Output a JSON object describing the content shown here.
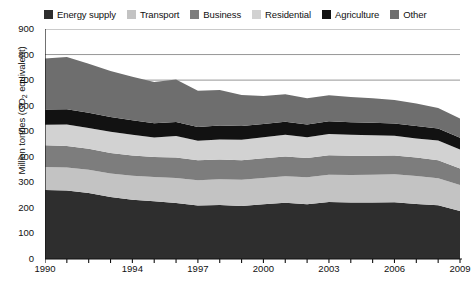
{
  "chart_data": {
    "type": "area",
    "stacked": true,
    "title": "",
    "xlabel": "",
    "ylabel": "Million tonnes (CO2 equivalent)",
    "ylabel_display": "Million tonnes (CO",
    "ylabel_sub": "2",
    "ylabel_tail": " equivalent)",
    "ylim": [
      0,
      900
    ],
    "ytick_labels": [
      "900",
      "800",
      "700",
      "600",
      "500",
      "400",
      "300",
      "200",
      "100",
      "0"
    ],
    "ytick_values": [
      900,
      800,
      700,
      600,
      500,
      400,
      300,
      200,
      100,
      0
    ],
    "xlim": [
      1990,
      2009
    ],
    "xtick_labels": [
      "1990",
      "1994",
      "1997",
      "2000",
      "2003",
      "2006",
      "2009"
    ],
    "xtick_values": [
      1990,
      1994,
      1997,
      2000,
      2003,
      2006,
      2009
    ],
    "grid": "horizontal-top-only",
    "gridlines": [
      900,
      800,
      700
    ],
    "legend_position": "top",
    "x": [
      1990,
      1991,
      1992,
      1993,
      1994,
      1995,
      1996,
      1997,
      1998,
      1999,
      2000,
      2001,
      2002,
      2003,
      2004,
      2005,
      2006,
      2007,
      2008,
      2009
    ],
    "series": [
      {
        "name": "Energy supply",
        "color": "#2e2e2e",
        "values": [
          270,
          268,
          258,
          243,
          232,
          226,
          219,
          209,
          211,
          207,
          214,
          220,
          214,
          223,
          221,
          221,
          222,
          215,
          210,
          188
        ]
      },
      {
        "name": "Transport",
        "color": "#c3c3c3",
        "values": [
          90,
          90,
          91,
          92,
          94,
          95,
          98,
          99,
          101,
          103,
          103,
          104,
          106,
          107,
          108,
          109,
          110,
          110,
          106,
          102
        ]
      },
      {
        "name": "Business",
        "color": "#7d7d7d",
        "values": [
          85,
          84,
          82,
          80,
          79,
          78,
          80,
          78,
          77,
          76,
          77,
          77,
          75,
          76,
          75,
          74,
          73,
          72,
          70,
          64
        ]
      },
      {
        "name": "Residential",
        "color": "#d2d2d2",
        "values": [
          80,
          84,
          82,
          83,
          81,
          76,
          84,
          77,
          79,
          81,
          82,
          85,
          81,
          83,
          82,
          80,
          77,
          75,
          78,
          74
        ]
      },
      {
        "name": "Agriculture",
        "color": "#121212",
        "values": [
          60,
          60,
          59,
          58,
          57,
          56,
          55,
          54,
          54,
          53,
          52,
          51,
          50,
          50,
          49,
          49,
          48,
          48,
          47,
          46
        ]
      },
      {
        "name": "Other",
        "color": "#6e6e6e",
        "values": [
          200,
          204,
          192,
          180,
          170,
          162,
          166,
          141,
          139,
          122,
          110,
          108,
          103,
          102,
          99,
          96,
          92,
          88,
          80,
          76
        ]
      }
    ],
    "totals": [
      785,
      790,
      764,
      736,
      713,
      693,
      702,
      658,
      661,
      642,
      638,
      645,
      629,
      641,
      634,
      629,
      622,
      608,
      591,
      550
    ]
  },
  "legend": {
    "items": [
      {
        "label": "Energy supply",
        "color": "#2e2e2e"
      },
      {
        "label": "Transport",
        "color": "#c3c3c3"
      },
      {
        "label": "Business",
        "color": "#7d7d7d"
      },
      {
        "label": "Residential",
        "color": "#d2d2d2"
      },
      {
        "label": "Agriculture",
        "color": "#121212"
      },
      {
        "label": "Other",
        "color": "#6e6e6e"
      }
    ]
  },
  "axis_style": {
    "axis_color": "#111111",
    "gridline_color": "#8a8a8a",
    "background": "#ffffff"
  }
}
